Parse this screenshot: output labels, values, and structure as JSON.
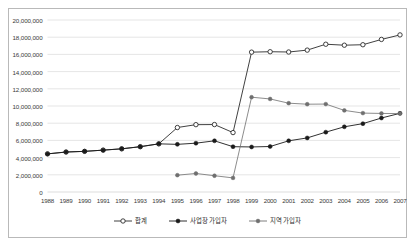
{
  "chart_data": {
    "type": "line",
    "title": "",
    "xlabel": "",
    "ylabel": "",
    "x": [
      1988,
      1989,
      1990,
      1991,
      1992,
      1993,
      1994,
      1995,
      1996,
      1997,
      1998,
      1999,
      2000,
      2001,
      2002,
      2003,
      2004,
      2005,
      2006,
      2007
    ],
    "categories": [
      "1988",
      "1989",
      "1990",
      "1991",
      "1992",
      "1993",
      "1994",
      "1995",
      "1996",
      "1997",
      "1998",
      "1999",
      "2000",
      "2001",
      "2002",
      "2003",
      "2004",
      "2005",
      "2006",
      "2007"
    ],
    "ylim": [
      0,
      20000000
    ],
    "ytick_values": [
      0,
      2000000,
      4000000,
      6000000,
      8000000,
      10000000,
      12000000,
      14000000,
      16000000,
      18000000,
      20000000
    ],
    "ytick_labels": [
      "0",
      "2,000,000",
      "4,000,000",
      "6,000,000",
      "8,000,000",
      "10,000,000",
      "12,000,000",
      "14,000,000",
      "16,000,000",
      "18,000,000",
      "20,000,000"
    ],
    "grid": true,
    "grid_axis": "y",
    "legend_position": "bottom",
    "series": [
      {
        "name": "합계",
        "marker": "open-circle",
        "color": "#2b2b2b",
        "values": [
          4433000,
          4648000,
          4727000,
          4869000,
          5021000,
          5267000,
          5600000,
          7497000,
          7830000,
          7843000,
          6909000,
          16262000,
          16310000,
          16278000,
          16498000,
          17182000,
          17070000,
          17124000,
          17740000,
          18267000
        ]
      },
      {
        "name": "사업장 가입자",
        "marker": "filled-circle",
        "color": "#1a1a1a",
        "values": [
          4433000,
          4648000,
          4727000,
          4869000,
          5021000,
          5267000,
          5600000,
          5541000,
          5677000,
          5951000,
          5269000,
          5238000,
          5291000,
          5951000,
          6288000,
          6958000,
          7580000,
          7950000,
          8604000,
          9149000
        ]
      },
      {
        "name": "지역 가입자",
        "marker": "gray-circle",
        "color": "#6f6f6f",
        "values": [
          null,
          null,
          null,
          null,
          null,
          null,
          null,
          1956000,
          2153000,
          1892000,
          1640000,
          11024000,
          10819000,
          10327000,
          10210000,
          10224000,
          9490000,
          9174000,
          9136000,
          9118000
        ]
      }
    ]
  },
  "legend": {
    "items": [
      {
        "label": "합계",
        "marker": "open-circle"
      },
      {
        "label": "사업장 가입자",
        "marker": "filled-circle"
      },
      {
        "label": "지역 가입자",
        "marker": "gray-circle"
      }
    ]
  },
  "colors": {
    "total": "#2b2b2b",
    "workplace": "#1a1a1a",
    "regional": "#6f6f6f",
    "grid": "#d4d4d4",
    "frame": "#b9b9b9",
    "text": "#3a3a3a"
  }
}
